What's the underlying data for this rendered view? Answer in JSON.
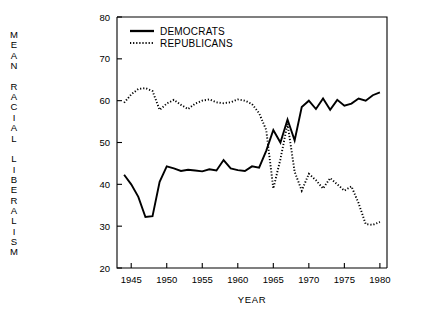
{
  "chart_data": {
    "type": "line",
    "title": "",
    "xlabel": "YEAR",
    "ylabel": "MEAN RACIAL LIBERALISM",
    "ylabel_letters": [
      "M",
      "E",
      "A",
      "N",
      "",
      "R",
      "A",
      "C",
      "I",
      "A",
      "L",
      "",
      "L",
      "I",
      "B",
      "E",
      "R",
      "A",
      "L",
      "I",
      "S",
      "M"
    ],
    "xlim": [
      1943,
      1981
    ],
    "ylim": [
      20,
      80
    ],
    "xticks": [
      1945,
      1950,
      1955,
      1960,
      1965,
      1970,
      1975,
      1980
    ],
    "xtick_labels": [
      "1945",
      "1950",
      "1955",
      "1960",
      "1965",
      "1970",
      "1975",
      "1980"
    ],
    "yticks": [
      20,
      30,
      40,
      50,
      60,
      70,
      80
    ],
    "ytick_labels": [
      "20",
      "30",
      "40",
      "50",
      "60",
      "70",
      "80"
    ],
    "grid": false,
    "legend_position": "upper-left-inside",
    "series": [
      {
        "name": "DEMOCRATS",
        "style": "solid",
        "color": "#000000",
        "x": [
          1944,
          1945,
          1946,
          1947,
          1948,
          1949,
          1950,
          1951,
          1952,
          1953,
          1954,
          1955,
          1956,
          1957,
          1958,
          1959,
          1960,
          1961,
          1962,
          1963,
          1964,
          1965,
          1966,
          1967,
          1968,
          1969,
          1970,
          1971,
          1972,
          1973,
          1974,
          1975,
          1976,
          1977,
          1978,
          1979,
          1980
        ],
        "values": [
          42.3,
          40.0,
          37.0,
          32.2,
          32.4,
          40.6,
          44.3,
          43.8,
          43.2,
          43.5,
          43.3,
          43.1,
          43.6,
          43.3,
          45.8,
          43.8,
          43.4,
          43.2,
          44.3,
          44.0,
          48.0,
          53.0,
          50.0,
          55.5,
          50.5,
          58.5,
          60.0,
          58.0,
          60.5,
          57.8,
          60.2,
          58.8,
          59.3,
          60.5,
          60.0,
          61.3,
          62.0
        ]
      },
      {
        "name": "REPUBLICANS",
        "style": "dotted",
        "color": "#000000",
        "x": [
          1944,
          1945,
          1946,
          1947,
          1948,
          1949,
          1950,
          1951,
          1952,
          1953,
          1954,
          1955,
          1956,
          1957,
          1958,
          1959,
          1960,
          1961,
          1962,
          1963,
          1964,
          1965,
          1966,
          1967,
          1968,
          1969,
          1970,
          1971,
          1972,
          1973,
          1974,
          1975,
          1976,
          1977,
          1978,
          1979,
          1980
        ],
        "values": [
          59.5,
          61.5,
          62.8,
          63.0,
          62.3,
          57.8,
          59.3,
          60.2,
          59.0,
          58.0,
          59.3,
          60.0,
          60.3,
          59.6,
          59.4,
          59.6,
          60.3,
          60.0,
          59.2,
          57.0,
          53.0,
          39.0,
          46.0,
          54.5,
          43.0,
          38.5,
          42.5,
          41.0,
          39.0,
          41.5,
          40.0,
          38.5,
          39.5,
          35.5,
          30.5,
          30.3,
          31.0
        ]
      }
    ]
  },
  "legend": {
    "items": [
      {
        "label": "DEMOCRATS",
        "style": "solid"
      },
      {
        "label": "REPUBLICANS",
        "style": "dotted"
      }
    ]
  }
}
